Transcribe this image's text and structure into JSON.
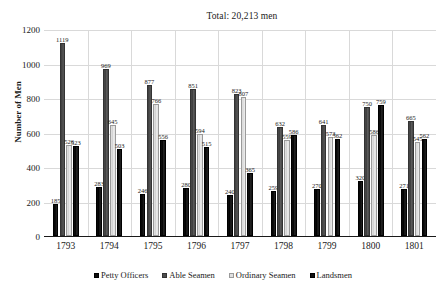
{
  "chart_data": {
    "type": "bar",
    "title": "Total: 20,213 men",
    "xlabel": "",
    "ylabel": "Number of Men",
    "ylim": [
      0,
      1200
    ],
    "ytick_step": 200,
    "yticks": [
      0,
      200,
      400,
      600,
      800,
      1000,
      1200
    ],
    "grid": true,
    "legend_position": "bottom",
    "categories": [
      "1793",
      "1794",
      "1795",
      "1796",
      "1797",
      "1798",
      "1799",
      "1800",
      "1801"
    ],
    "series": [
      {
        "name": "Petty Officers",
        "color": "#0d0d0d",
        "values": [
          185,
          283,
          246,
          280,
          240,
          259,
          270,
          320,
          271
        ]
      },
      {
        "name": "Able Seamen",
        "color": "#4d4d4d",
        "values": [
          1119,
          969,
          877,
          851,
          823,
          632,
          641,
          750,
          665
        ]
      },
      {
        "name": "Ordinary Seamen",
        "color": "#e0e0e0",
        "values": [
          526,
          645,
          766,
          594,
          807,
          559,
          573,
          586,
          545
        ]
      },
      {
        "name": "Landsmen",
        "color": "#111111",
        "values": [
          523,
          503,
          556,
          515,
          365,
          586,
          562,
          759,
          562
        ]
      }
    ]
  }
}
